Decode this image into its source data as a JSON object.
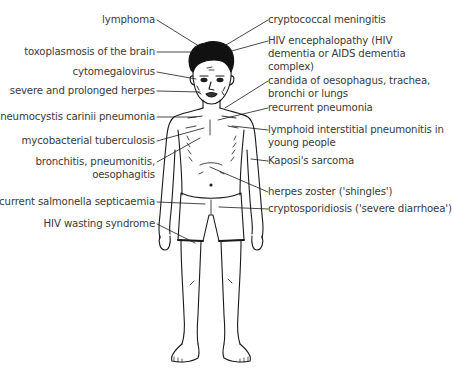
{
  "diagram": {
    "line_color": "#1a1a1a",
    "text_color": "#3a3a3a",
    "labels_left": [
      {
        "id": "lymphoma",
        "text": "lymphoma"
      },
      {
        "id": "toxoplasmosis",
        "text": "toxoplasmosis of the brain"
      },
      {
        "id": "cytomegalovirus",
        "text": "cytomegalovirus"
      },
      {
        "id": "herpes",
        "text": "severe and prolonged herpes"
      },
      {
        "id": "pcp",
        "text": "pneumocystis carinii pneumonia"
      },
      {
        "id": "tb",
        "text": "mycobacterial tuberculosis"
      },
      {
        "id": "bronchitis_1",
        "text": "bronchitis, pneumonitis,"
      },
      {
        "id": "bronchitis_2",
        "text": "oesophagitis"
      },
      {
        "id": "salmonella",
        "text": "recurrent salmonella septicaemia"
      },
      {
        "id": "wasting",
        "text": "HIV wasting syndrome"
      }
    ],
    "labels_right": [
      {
        "id": "crypto_meningitis",
        "text": "cryptococcal meningitis"
      },
      {
        "id": "hiv_enceph_1",
        "text": "HIV encephalopathy (HIV"
      },
      {
        "id": "hiv_enceph_2",
        "text": "dementia or AIDS dementia"
      },
      {
        "id": "hiv_enceph_3",
        "text": "complex)"
      },
      {
        "id": "candida_1",
        "text": "candida of oesophagus, trachea,"
      },
      {
        "id": "candida_2",
        "text": "bronchi or lungs"
      },
      {
        "id": "recurrent_pneumonia",
        "text": "recurrent pneumonia"
      },
      {
        "id": "lip_1",
        "text": "lymphoid interstitial pneumonitis in"
      },
      {
        "id": "lip_2",
        "text": "young people"
      },
      {
        "id": "kaposi",
        "text": "Kaposi's sarcoma"
      },
      {
        "id": "zoster",
        "text": "herpes zoster ('shingles')"
      },
      {
        "id": "cryptosporidiosis",
        "text": "cryptosporidiosis ('severe diarrhoea')"
      }
    ]
  }
}
